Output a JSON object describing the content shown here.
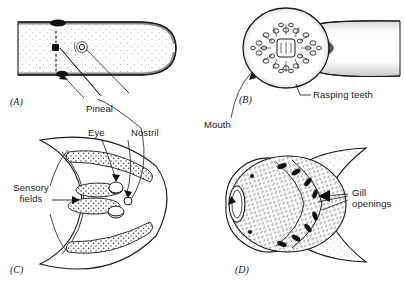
{
  "figure": {
    "kind": "scientific-illustration",
    "background_color": "#ffffff",
    "ink_color": "#1a1a1a",
    "panels": [
      {
        "id": "A",
        "id_label": "(A)",
        "name": "dorsal-head-view"
      },
      {
        "id": "B",
        "id_label": "(B)",
        "name": "oral-disc-view"
      },
      {
        "id": "C",
        "id_label": "(C)",
        "name": "anterior-head-view"
      },
      {
        "id": "D",
        "id_label": "(D)",
        "name": "ventral-head-view"
      }
    ],
    "labels": {
      "pineal": "Pineal",
      "eye": "Eye",
      "nostril": "Nostril",
      "rasping_teeth": "Rasping teeth",
      "mouth": "Mouth",
      "sensory_fields_line1": "Sensory",
      "sensory_fields_line2": "fields",
      "gill_line1": "Gill",
      "gill_line2": "openings"
    }
  }
}
